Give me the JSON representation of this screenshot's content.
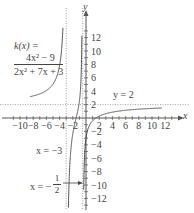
{
  "chart_data": {
    "type": "line",
    "title": "",
    "function_label": "k(x) =",
    "numerator": "4x² − 9",
    "denominator": "2x² + 7x + 3",
    "xlabel": "x",
    "ylabel": "y",
    "xlim": [
      -11,
      13
    ],
    "ylim": [
      -13,
      13
    ],
    "x_tick_labels": [
      "-10",
      "-8",
      "-6",
      "-4",
      "-2",
      "2",
      "4",
      "6",
      "8",
      "10",
      "12"
    ],
    "y_tick_labels": [
      "12",
      "10",
      "8",
      "6",
      "4",
      "2",
      "-2",
      "-4",
      "-6",
      "-8",
      "-10",
      "-12"
    ],
    "grid": false,
    "asymptotes": [
      {
        "type": "horizontal",
        "label": "y = 2",
        "value": 2
      },
      {
        "type": "vertical",
        "label": "x = -3",
        "value": -3
      },
      {
        "type": "vertical",
        "label": "x = -1/2",
        "value": -0.5
      }
    ],
    "series": [
      {
        "name": "k(x) left branch",
        "x": [
          -10,
          -8,
          -6,
          -5,
          -4,
          -3.5
        ],
        "y": [
          2.3,
          2.4,
          2.7,
          3.0,
          3.8,
          5.8
        ]
      },
      {
        "name": "k(x) middle branch",
        "x": [
          -2.8,
          -2.5,
          -2,
          -1.5,
          -1,
          -0.7
        ],
        "y": [
          -4.7,
          -2.0,
          0.0,
          2.0,
          5.0,
          10.0
        ]
      },
      {
        "name": "k(x) right branch",
        "x": [
          -0.3,
          0,
          1,
          2,
          4,
          6,
          8,
          10,
          12
        ],
        "y": [
          -9.0,
          -3.0,
          0.0,
          1.0,
          1.6,
          1.75,
          1.8,
          1.85,
          1.9
        ]
      }
    ]
  },
  "labels": {
    "function_name": "k(x) =",
    "numerator": "4x² − 9",
    "denominator": "2x² + 7x + 3",
    "h_asymptote": "y = 2",
    "v_asymptote_1": "x = −3",
    "v_asymptote_2_prefix": "x = −",
    "v_asymptote_2_num": "1",
    "v_asymptote_2_den": "2",
    "x_axis": "x",
    "y_axis": "y"
  }
}
